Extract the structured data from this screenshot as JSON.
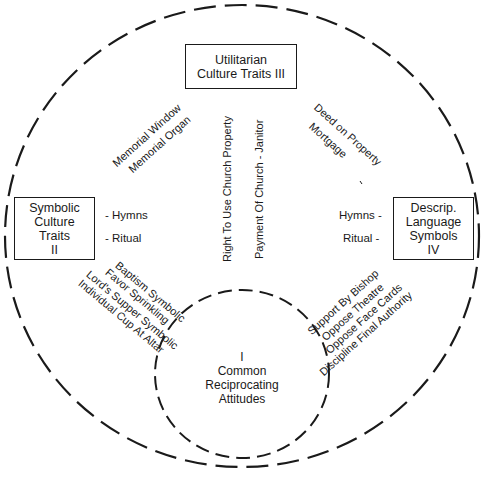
{
  "diagram": {
    "outer_circle": {
      "style": "dashed",
      "color": "#1a1a1a"
    },
    "inner_circle": {
      "style": "dashed",
      "color": "#1a1a1a"
    },
    "center": {
      "numeral": "I",
      "line1": "Common",
      "line2": "Reciprocating",
      "line3": "Attitudes"
    },
    "boxes": {
      "top": {
        "line1": "Utilitarian",
        "line2": "Culture Traits III"
      },
      "left": {
        "line1": "Symbolic",
        "line2": "Culture",
        "line3": "Traits",
        "line4": "II"
      },
      "right": {
        "line1": "Descrip.",
        "line2": "Language",
        "line3": "Symbols",
        "line4": "IV"
      }
    },
    "left_items": [
      "- Hymns",
      "- Ritual"
    ],
    "right_items": [
      "Hymns -",
      "Ritual -"
    ],
    "upper_left_diagonal": [
      "Memorial Window",
      "Memorial Organ"
    ],
    "upper_right_diagonal": [
      "Deed on Property",
      "Mortgage"
    ],
    "vertical_center": [
      "Right To Use Church Property",
      "Payment Of Church - Janitor"
    ],
    "lower_left_diagonal": [
      "Baptism Symbolic",
      "Favor Sprinkling",
      "Lord's Supper Symbolic",
      "Individual Cup At Altar"
    ],
    "lower_right_diagonal": [
      "Support By Bishop",
      "Oppose Theatre",
      "Oppose Face Cards",
      "Discipline Final Authority"
    ]
  }
}
